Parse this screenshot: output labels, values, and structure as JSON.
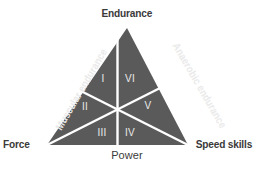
{
  "diagram": {
    "type": "triangle-sector-diagram",
    "colors": {
      "fill": "#5a5a5a",
      "divider": "#ffffff",
      "outer_text": "#3a3a3a",
      "inner_text": "#eaeaea",
      "background": "#ffffff"
    },
    "vertices": {
      "top": "Endurance",
      "bottom_left": "Force",
      "bottom_right": "Speed skills"
    },
    "edges": {
      "base": "Power",
      "left": "Muscular endurance",
      "right": "Anaerobic endurance"
    },
    "sectors": [
      {
        "id": "sector-1",
        "numeral": "I",
        "position": "upper-left",
        "cx": 103,
        "cy": 79
      },
      {
        "id": "sector-6",
        "numeral": "VI",
        "position": "upper-right",
        "cx": 130,
        "cy": 79
      },
      {
        "id": "sector-2",
        "numeral": "II",
        "position": "mid-left",
        "cx": 85,
        "cy": 107
      },
      {
        "id": "sector-5",
        "numeral": "V",
        "position": "mid-right",
        "cx": 148,
        "cy": 106
      },
      {
        "id": "sector-3",
        "numeral": "III",
        "position": "lower-left",
        "cx": 102,
        "cy": 133
      },
      {
        "id": "sector-4",
        "numeral": "IV",
        "position": "lower-right",
        "cx": 130,
        "cy": 133
      }
    ]
  }
}
